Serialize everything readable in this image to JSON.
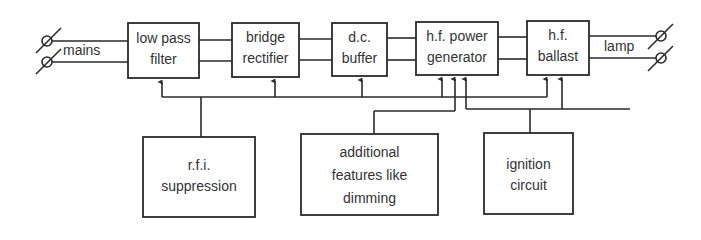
{
  "diagram": {
    "title": "",
    "blocks": {
      "low_pass_filter": {
        "line1": "low pass",
        "line2": "filter"
      },
      "bridge_rectifier": {
        "line1": "bridge",
        "line2": "rectifier"
      },
      "dc_buffer": {
        "line1": "d.c.",
        "line2": "buffer"
      },
      "hf_power_generator": {
        "line1": "h.f. power",
        "line2": "generator"
      },
      "hf_ballast": {
        "line1": "h.f.",
        "line2": "ballast"
      },
      "rfi_suppression": {
        "line1": "r.f.i.",
        "line2": "suppression"
      },
      "additional_features": {
        "line1": "additional",
        "line2": "features like",
        "line3": "dimming"
      },
      "ignition_circuit": {
        "line1": "ignition",
        "line2": "circuit"
      }
    },
    "terminals": {
      "input_label": "mains",
      "output_label": "lamp"
    },
    "connections": [
      {
        "from": "mains",
        "to": "low pass filter",
        "type": "two-wire"
      },
      {
        "from": "low pass filter",
        "to": "bridge rectifier",
        "type": "two-wire"
      },
      {
        "from": "bridge rectifier",
        "to": "d.c. buffer",
        "type": "two-wire"
      },
      {
        "from": "d.c. buffer",
        "to": "h.f. power generator",
        "type": "two-wire"
      },
      {
        "from": "h.f. power generator",
        "to": "h.f. ballast",
        "type": "two-wire"
      },
      {
        "from": "h.f. ballast",
        "to": "lamp",
        "type": "two-wire"
      },
      {
        "from": "r.f.i. suppression",
        "to": [
          "low pass filter",
          "bridge rectifier",
          "d.c. buffer",
          "h.f. power generator",
          "h.f. ballast"
        ],
        "type": "control-bus"
      },
      {
        "from": "additional features like dimming",
        "to": "h.f. power generator",
        "type": "control"
      },
      {
        "from": "ignition circuit",
        "to": [
          "h.f. power generator",
          "h.f. ballast"
        ],
        "type": "control"
      }
    ],
    "colors": {
      "line": "#2a2a2a",
      "text": "#333333",
      "background": "#ffffff"
    }
  }
}
